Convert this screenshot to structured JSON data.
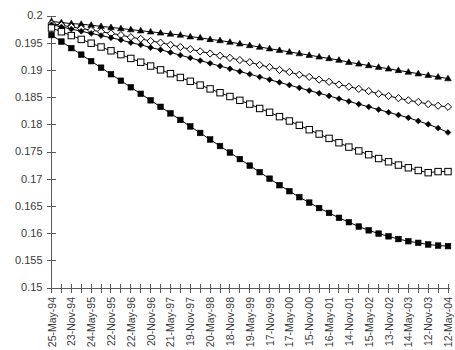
{
  "chart_data": {
    "type": "line",
    "title": "",
    "subtitle": "",
    "xlabel": "",
    "ylabel": "",
    "ylim": [
      0.15,
      0.2
    ],
    "ytick_values": [
      0.15,
      0.155,
      0.16,
      0.165,
      0.17,
      0.175,
      0.18,
      0.185,
      0.19,
      0.195,
      0.2
    ],
    "ytick_labels": [
      "0.15",
      "0.155",
      "0.16",
      "0.165",
      "0.17",
      "0.175",
      "0.18",
      "0.185",
      "0.19",
      "0.195",
      "0.2"
    ],
    "grid": false,
    "legend": "none",
    "x_labeled_every": 2,
    "x": [
      "25-May-94",
      "",
      "23-Nov-94",
      "",
      "24-May-95",
      "",
      "22-Nov-95",
      "",
      "22-May-96",
      "",
      "20-Nov-96",
      "",
      "21-May-97",
      "",
      "19-Nov-97",
      "",
      "20-May-98",
      "",
      "18-Nov-98",
      "",
      "19-May-99",
      "",
      "17-Nov-99",
      "",
      "17-May-00",
      "",
      "15-Nov-00",
      "",
      "16-May-01",
      "",
      "14-Nov-01",
      "",
      "15-May-02",
      "",
      "13-Nov-02",
      "",
      "14-May-03",
      "",
      "12-Nov-03",
      "",
      "12-May-04"
    ],
    "xtick_labels": [
      "25-May-94",
      "23-Nov-94",
      "24-May-95",
      "22-Nov-95",
      "22-May-96",
      "20-Nov-96",
      "21-May-97",
      "19-Nov-97",
      "20-May-98",
      "18-Nov-98",
      "19-May-99",
      "17-Nov-99",
      "17-May-00",
      "15-Nov-00",
      "16-May-01",
      "14-Nov-01",
      "15-May-02",
      "13-Nov-02",
      "14-May-03",
      "12-Nov-03",
      "12-May-04"
    ],
    "series": [
      {
        "name": "series-1",
        "marker": "filled-triangle",
        "color": "#000000",
        "values": [
          0.199,
          0.1988,
          0.1986,
          0.1985,
          0.1983,
          0.1981,
          0.1979,
          0.1977,
          0.1975,
          0.1973,
          0.1971,
          0.1969,
          0.1967,
          0.1965,
          0.1962,
          0.196,
          0.1957,
          0.1955,
          0.1952,
          0.1949,
          0.1946,
          0.1943,
          0.194,
          0.1937,
          0.1934,
          0.1931,
          0.1928,
          0.1925,
          0.1922,
          0.1919,
          0.1915,
          0.1912,
          0.1909,
          0.1906,
          0.1903,
          0.19,
          0.1897,
          0.1894,
          0.1891,
          0.1888,
          0.1885
        ]
      },
      {
        "name": "series-2",
        "marker": "open-diamond",
        "color": "#000000",
        "values": [
          0.1986,
          0.1983,
          0.198,
          0.1977,
          0.1974,
          0.1971,
          0.1968,
          0.1965,
          0.1961,
          0.1958,
          0.1954,
          0.1951,
          0.1947,
          0.1943,
          0.1939,
          0.1935,
          0.1931,
          0.1927,
          0.1923,
          0.1919,
          0.1915,
          0.191,
          0.1906,
          0.1901,
          0.1897,
          0.1892,
          0.1888,
          0.1883,
          0.1879,
          0.1874,
          0.187,
          0.1866,
          0.1862,
          0.1857,
          0.1853,
          0.1849,
          0.1845,
          0.1842,
          0.1838,
          0.1835,
          0.1833
        ]
      },
      {
        "name": "series-3",
        "marker": "filled-diamond",
        "color": "#000000",
        "values": [
          0.1984,
          0.198,
          0.1976,
          0.1972,
          0.1968,
          0.1964,
          0.196,
          0.1956,
          0.1951,
          0.1947,
          0.1942,
          0.1938,
          0.1933,
          0.1928,
          0.1923,
          0.1918,
          0.1913,
          0.1908,
          0.1903,
          0.1898,
          0.1893,
          0.1888,
          0.1883,
          0.1878,
          0.1873,
          0.1868,
          0.1863,
          0.1858,
          0.1853,
          0.1848,
          0.1843,
          0.1838,
          0.1833,
          0.1828,
          0.1823,
          0.1818,
          0.1813,
          0.1807,
          0.1801,
          0.1794,
          0.1786
        ]
      },
      {
        "name": "series-4",
        "marker": "open-square",
        "color": "#000000",
        "values": [
          0.1978,
          0.1971,
          0.1964,
          0.1957,
          0.195,
          0.1943,
          0.1936,
          0.1929,
          0.1922,
          0.1915,
          0.1908,
          0.1901,
          0.1894,
          0.1887,
          0.188,
          0.1873,
          0.1866,
          0.1859,
          0.1852,
          0.1845,
          0.1838,
          0.183,
          0.1823,
          0.1815,
          0.1807,
          0.1799,
          0.1791,
          0.1783,
          0.1775,
          0.1767,
          0.1759,
          0.1752,
          0.1745,
          0.1738,
          0.1732,
          0.1726,
          0.1721,
          0.1716,
          0.1712,
          0.1714,
          0.1714
        ]
      },
      {
        "name": "series-5",
        "marker": "filled-square",
        "color": "#000000",
        "values": [
          0.1965,
          0.1953,
          0.1941,
          0.1929,
          0.1917,
          0.1905,
          0.1893,
          0.1881,
          0.1869,
          0.1857,
          0.1845,
          0.1833,
          0.1821,
          0.1809,
          0.1797,
          0.1785,
          0.1773,
          0.1761,
          0.1749,
          0.1737,
          0.1725,
          0.1713,
          0.1701,
          0.1689,
          0.1678,
          0.1667,
          0.1657,
          0.1647,
          0.1638,
          0.1629,
          0.1621,
          0.1613,
          0.1606,
          0.16,
          0.1595,
          0.159,
          0.1586,
          0.1583,
          0.158,
          0.1578,
          0.1577
        ]
      }
    ]
  }
}
